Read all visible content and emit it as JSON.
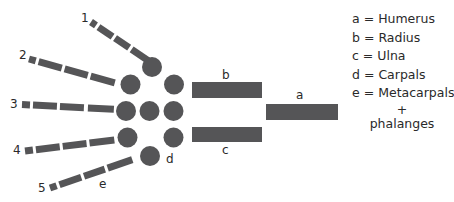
{
  "diagram": {
    "finger_labels": [
      "1",
      "2",
      "3",
      "4",
      "5"
    ],
    "bone_labels": {
      "a": "a",
      "b": "b",
      "c": "c",
      "d": "d",
      "e": "e"
    },
    "bone_color": "#555557",
    "legend": [
      {
        "key": "a",
        "sep": "=",
        "value": "Humerus"
      },
      {
        "key": "b",
        "sep": "=",
        "value": "Radius"
      },
      {
        "key": "c",
        "sep": "=",
        "value": "Ulna"
      },
      {
        "key": "d",
        "sep": "=",
        "value": "Carpals"
      },
      {
        "key": "e",
        "sep": "=",
        "value": "Metacarpals"
      }
    ],
    "legend_plus": "+",
    "legend_cont": "phalanges"
  }
}
